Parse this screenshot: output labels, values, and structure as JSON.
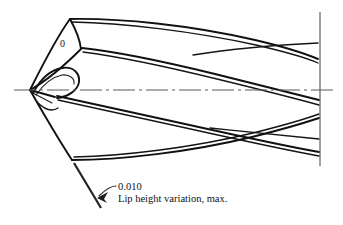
{
  "figure": {
    "background_color": "#ffffff",
    "line_color": "#111111",
    "centerline_color": "#585858"
  },
  "labels": {
    "angle_marker": "0",
    "callout_value": "0.010",
    "callout_description": "Lip height variation, max."
  },
  "annotations": {
    "leader_name": "lip-height-leader",
    "arrow_name": "leader-arrowhead",
    "dimension_name": "lip-height-dimension-line",
    "centerline_name": "drill-axis-centerline",
    "cutline_name": "break-cut-line"
  },
  "geometry": {
    "axis_y": 90,
    "tip_x": 30,
    "cut_line_x": 320,
    "cut_line_top": 12,
    "cut_line_bottom": 166
  }
}
